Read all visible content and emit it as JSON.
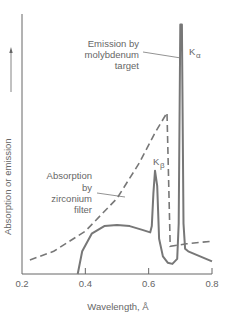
{
  "chart_data": {
    "type": "line",
    "title": "",
    "xlabel": "Wavelength, Å",
    "ylabel": "Absorption or emission",
    "xlim": [
      0.2,
      0.8
    ],
    "ylim": [
      0,
      1
    ],
    "x_ticks": [
      "0.2",
      "0.4",
      "0.6",
      "0.8"
    ],
    "grid": false,
    "series": [
      {
        "name": "Emission by molybdenum target",
        "style": "solid",
        "points": [
          [
            0.376,
            0.0
          ],
          [
            0.39,
            0.09
          ],
          [
            0.42,
            0.16
          ],
          [
            0.46,
            0.19
          ],
          [
            0.5,
            0.195
          ],
          [
            0.54,
            0.19
          ],
          [
            0.58,
            0.175
          ],
          [
            0.605,
            0.165
          ],
          [
            0.61,
            0.19
          ],
          [
            0.615,
            0.32
          ],
          [
            0.62,
            0.41
          ],
          [
            0.627,
            0.35
          ],
          [
            0.633,
            0.14
          ],
          [
            0.645,
            0.07
          ],
          [
            0.66,
            0.045
          ],
          [
            0.675,
            0.04
          ],
          [
            0.69,
            0.06
          ],
          [
            0.695,
            0.2
          ],
          [
            0.7,
            0.99
          ],
          [
            0.705,
            0.99
          ],
          [
            0.71,
            0.2
          ],
          [
            0.715,
            0.1
          ],
          [
            0.725,
            0.09
          ],
          [
            0.8,
            0.05
          ]
        ]
      },
      {
        "name": "Absorption by zirconium filter",
        "style": "dashed",
        "points": [
          [
            0.225,
            0.056
          ],
          [
            0.3,
            0.09
          ],
          [
            0.4,
            0.17
          ],
          [
            0.5,
            0.3
          ],
          [
            0.57,
            0.44
          ],
          [
            0.62,
            0.56
          ],
          [
            0.658,
            0.64
          ],
          [
            0.668,
            0.11
          ],
          [
            0.72,
            0.12
          ],
          [
            0.8,
            0.13
          ]
        ]
      }
    ],
    "annotations": [
      {
        "text_lines": [
          "Emission by",
          "molybdenum",
          "target"
        ],
        "target": "Kα peak"
      },
      {
        "text_lines": [
          "Absorption",
          "by",
          "zirconium",
          "filter"
        ],
        "target": "dashed curve"
      },
      {
        "text": "K",
        "subscript": "α"
      },
      {
        "text": "K",
        "subscript": "β"
      }
    ]
  }
}
